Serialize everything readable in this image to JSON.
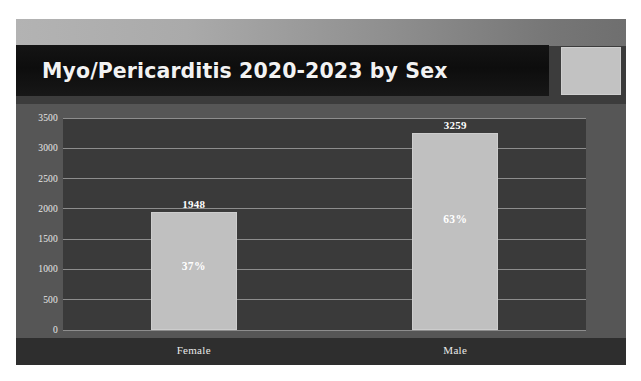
{
  "figure": {
    "title": "Myo/Pericarditis 2020-2023 by Sex",
    "clipped_header_text": "",
    "side_box_name": "logo-placeholder",
    "colors": {
      "canvas_background": "#3c3c3c",
      "plot_background": "#3a3a3a",
      "plot_outer_background": "#565656",
      "title_plate": "#0d0d0d",
      "bar_fill": "#c0c0c0",
      "gridline": "#8d8d8d",
      "text": "#ffffff",
      "category_band": "#2e2e2e",
      "side_box": "#c2c2c2"
    }
  },
  "chart_data": {
    "type": "bar",
    "title": "Myo/Pericarditis 2020-2023 by Sex",
    "xlabel": "",
    "ylabel": "",
    "categories": [
      "Female",
      "Male"
    ],
    "values": [
      1948,
      3259
    ],
    "data_labels": [
      "1948",
      "3259"
    ],
    "percent_labels": [
      "37%",
      "63%"
    ],
    "percents": [
      37,
      63
    ],
    "ylim": [
      0,
      3500
    ],
    "yticks": [
      0,
      500,
      1000,
      1500,
      2000,
      2500,
      3000,
      3500
    ],
    "ytick_labels": [
      "0",
      "500",
      "1000",
      "1500",
      "2000",
      "2500",
      "3000",
      "3500"
    ],
    "grid": true,
    "legend": false,
    "legend_position": "none",
    "series": [
      {
        "name": "Myo/Pericarditis cases 2020-2023",
        "values": [
          1948,
          3259
        ]
      }
    ]
  }
}
